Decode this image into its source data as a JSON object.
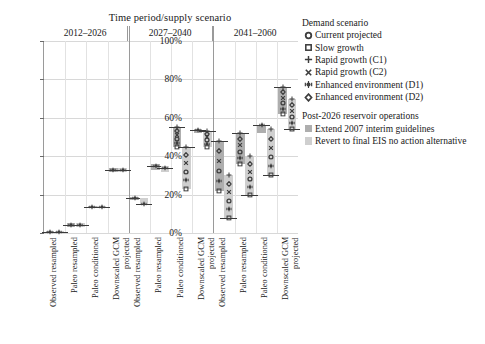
{
  "chart_data": {
    "type": "bar",
    "title": "Time period/supply scenario",
    "xlabel": "",
    "ylabel": "",
    "ylim": [
      0,
      100
    ],
    "yticks": [
      "0%",
      "20%",
      "40%",
      "60%",
      "80%",
      "100%"
    ],
    "grid": true,
    "legend_position": "right",
    "periods": [
      "2012–2026",
      "2027–2040",
      "2041–2060"
    ],
    "supply_scenarios": [
      "Observed resampled",
      "Paleo resampled",
      "Paleo conditioned",
      "Downscaled GCM\nprojected"
    ],
    "categories": [
      "2012-2026 / Observed resampled",
      "2012-2026 / Paleo resampled",
      "2012-2026 / Paleo conditioned",
      "2012-2026 / Downscaled GCM projected",
      "2027-2040 / Observed resampled",
      "2027-2040 / Paleo resampled",
      "2027-2040 / Paleo conditioned",
      "2027-2040 / Downscaled GCM projected",
      "2041-2060 / Observed resampled",
      "2041-2060 / Paleo resampled",
      "2041-2060 / Paleo conditioned",
      "2041-2060 / Downscaled GCM projected"
    ],
    "series": [
      {
        "name": "Extend 2007 interim guidelines",
        "color": "#aeaeae",
        "boxes": [
          {
            "low": 0,
            "high": 1,
            "median": 0.5
          },
          {
            "low": 3,
            "high": 5,
            "median": 4
          },
          {
            "low": 13,
            "high": 14,
            "median": 13.5
          },
          {
            "low": 32,
            "high": 34,
            "median": 33
          },
          {
            "low": 17,
            "high": 19,
            "median": 18
          },
          {
            "low": 33,
            "high": 36,
            "median": 35
          },
          {
            "low": 45,
            "high": 55,
            "median": 55
          },
          {
            "low": 52,
            "high": 54,
            "median": 53.5
          },
          {
            "low": 22,
            "high": 48,
            "median": 48
          },
          {
            "low": 36,
            "high": 52,
            "median": 52
          },
          {
            "low": 52,
            "high": 56,
            "median": 56
          },
          {
            "low": 62,
            "high": 76,
            "median": 76
          }
        ],
        "points": [
          {
            "sym": "circle-open",
            "v": 0.5
          },
          {
            "sym": "square-open",
            "v": 0.3
          },
          {
            "sym": "plus",
            "v": 0.8
          },
          {
            "sym": "cross",
            "v": 0.6
          },
          {
            "sym": "star-dot",
            "v": 0.5
          },
          {
            "sym": "diamond-open",
            "v": 0.7
          }
        ]
      },
      {
        "name": "Revert to final EIS no action alternative",
        "color": "#cfcfcf",
        "boxes": [
          {
            "low": 0,
            "high": 1,
            "median": 0.5
          },
          {
            "low": 3,
            "high": 5,
            "median": 4
          },
          {
            "low": 13,
            "high": 14,
            "median": 13.5
          },
          {
            "low": 32,
            "high": 34,
            "median": 33
          },
          {
            "low": 15,
            "high": 18,
            "median": 15
          },
          {
            "low": 32,
            "high": 35,
            "median": 34
          },
          {
            "low": 23,
            "high": 45,
            "median": 45
          },
          {
            "low": 45,
            "high": 53,
            "median": 53
          },
          {
            "low": 8,
            "high": 30,
            "median": 8
          },
          {
            "low": 20,
            "high": 40,
            "median": 20
          },
          {
            "low": 30,
            "high": 54,
            "median": 30
          },
          {
            "low": 54,
            "high": 70,
            "median": 54
          }
        ]
      }
    ],
    "annotation": "Box spans supply/demand ensemble range; horizontal rule marks median; symbols mark individual demand scenarios."
  },
  "legend": {
    "demand_title": "Demand scenario",
    "demand_items": [
      {
        "symbol": "circle-open-icon",
        "label": "Current projected"
      },
      {
        "symbol": "square-open-icon",
        "label": "Slow growth"
      },
      {
        "symbol": "plus-icon",
        "label": "Rapid growth (C1)"
      },
      {
        "symbol": "cross-icon",
        "label": "Rapid growth (C2)"
      },
      {
        "symbol": "star-dot-icon",
        "label": "Enhanced environment (D1)"
      },
      {
        "symbol": "diamond-open-icon",
        "label": "Enhanced environment (D2)"
      }
    ],
    "ops_title": "Post-2026 reservoir operations",
    "ops_items": [
      {
        "swatch": "#aeaeae",
        "label": "Extend 2007 interim guidelines"
      },
      {
        "swatch": "#cfcfcf",
        "label": "Revert to final EIS no action alternative"
      }
    ]
  }
}
